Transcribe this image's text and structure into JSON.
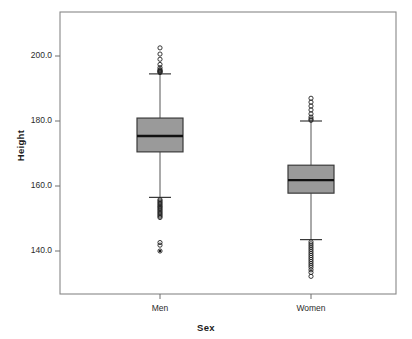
{
  "chart_data": {
    "type": "box",
    "title": "",
    "xlabel": "Sex",
    "ylabel": "Height",
    "categories": [
      "Men",
      "Women"
    ],
    "yticks": [
      140.0,
      160.0,
      180.0,
      200.0
    ],
    "ytick_labels": [
      "140.0",
      "160.0",
      "180.0",
      "200.0"
    ],
    "ylim": [
      129.0,
      207.5
    ],
    "grid": false,
    "legend": null,
    "box_fill": "#9a9a9a",
    "box_edge": "#3a3a3a",
    "median_color": "#111111",
    "whisker_color": "#555555",
    "outlier_color": "#222222",
    "frame_color": "#888888",
    "series": [
      {
        "name": "Men",
        "q1": 170.5,
        "median": 175.4,
        "q3": 180.9,
        "whisker_low": 156.5,
        "whisker_high": 194.5,
        "outliers_high": [
          202.5,
          200.6,
          199.0,
          197.4,
          196.4,
          195.8,
          195.5,
          195.3,
          195.1,
          194.9
        ],
        "outliers_low": [
          155.8,
          155.4,
          155.0,
          154.6,
          154.2,
          153.8,
          153.5,
          153.1,
          152.7,
          152.3,
          151.9,
          151.5,
          151.1,
          150.7,
          150.3,
          142.6,
          141.8,
          140.0
        ],
        "extreme_markers": [
          140.0
        ]
      },
      {
        "name": "Women",
        "q1": 157.8,
        "median": 161.8,
        "q3": 166.4,
        "whisker_low": 143.5,
        "whisker_high": 180.0,
        "outliers_high": [
          187.0,
          185.8,
          184.6,
          183.4,
          182.2,
          181.2,
          180.6,
          180.2
        ],
        "outliers_low": [
          142.8,
          142.2,
          141.6,
          141.0,
          140.4,
          139.8,
          139.2,
          138.6,
          138.0,
          137.4,
          136.8,
          136.2,
          135.6,
          135.0,
          134.2,
          133.4,
          132.2
        ],
        "extreme_markers": []
      }
    ]
  },
  "axes": {
    "y_title": "Height",
    "x_title": "Sex",
    "y_tick_0": "140.0",
    "y_tick_1": "160.0",
    "y_tick_2": "180.0",
    "y_tick_3": "200.0",
    "x_cat_0": "Men",
    "x_cat_1": "Women"
  }
}
